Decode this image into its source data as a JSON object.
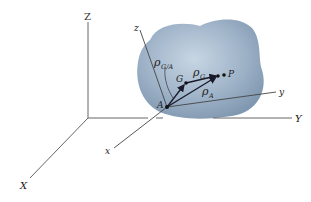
{
  "figure": {
    "inertial_axes": {
      "Z": "Z",
      "X": "X",
      "Y": "Y"
    },
    "body_axes": {
      "z": "z",
      "x": "x",
      "y": "y"
    },
    "points": {
      "A": "A",
      "G": "G",
      "P": "P"
    },
    "vectors": {
      "rho_ga": {
        "symbol": "ρ",
        "sub": "G/A"
      },
      "rho_g": {
        "symbol": "ρ",
        "sub": "G"
      },
      "rho_a": {
        "symbol": "ρ",
        "sub": "A"
      }
    },
    "colors": {
      "body": "#9fb3c8",
      "body_dark": "#7f97b0",
      "axis": "#555555",
      "vector": "#1a1a2a"
    }
  }
}
